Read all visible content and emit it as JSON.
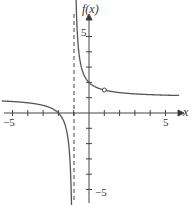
{
  "chart_data": {
    "type": "line",
    "title": "",
    "xlabel": "x",
    "ylabel": "f(x)",
    "xlim": [
      -5.5,
      6
    ],
    "ylim": [
      -5.5,
      6
    ],
    "grid": false,
    "x_tick_labels": [
      "-5",
      "5"
    ],
    "y_tick_labels": [
      "5",
      "-5"
    ],
    "function": "f(x) = (x+2)/(x+1)",
    "vertical_asymptote": -1,
    "horizontal_asymptote": 1,
    "key_points": [
      {
        "x": -2,
        "y": 0,
        "type": "x-intercept"
      },
      {
        "x": 0,
        "y": 2,
        "type": "y-intercept"
      },
      {
        "x": 1,
        "y": 1.5,
        "type": "open-circle"
      }
    ],
    "series": [
      {
        "name": "left-branch",
        "x": [
          -5.5,
          -4,
          -3,
          -2,
          -1.5,
          -1.2,
          -1.15
        ],
        "y": [
          0.78,
          0.67,
          0.5,
          0,
          -1,
          -4,
          -5.7
        ]
      },
      {
        "name": "right-branch",
        "x": [
          -0.85,
          -0.8,
          -0.5,
          0,
          1,
          2,
          3,
          4,
          5,
          6
        ],
        "y": [
          7.67,
          6,
          3,
          2,
          1.5,
          1.33,
          1.25,
          1.2,
          1.17,
          1.14
        ]
      }
    ]
  },
  "labels": {
    "ylabel": "f(x)",
    "xlabel": "x",
    "x_neg5": "−5",
    "x_pos5": "5",
    "y_pos5": "5",
    "y_neg5": "−5"
  }
}
